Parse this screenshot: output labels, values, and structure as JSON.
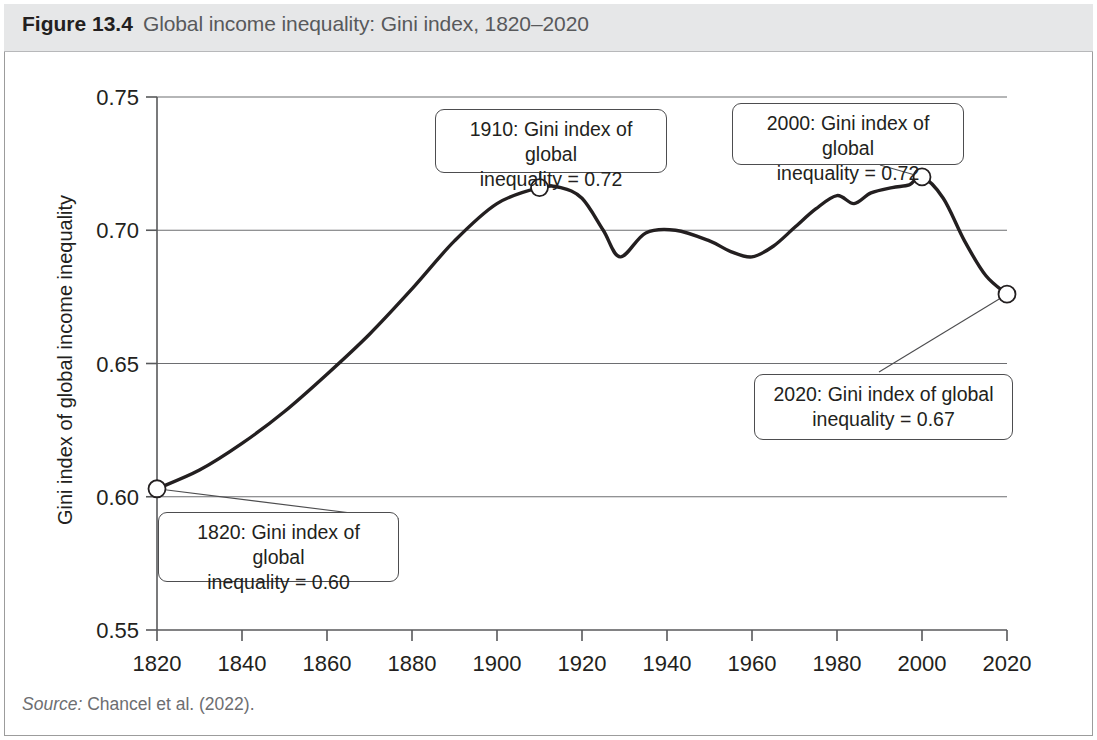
{
  "figure": {
    "number": "Figure 13.4",
    "caption": "Global income inequality: Gini index, 1820–2020",
    "source_word": "Source:",
    "source_text": " Chancel et al. (2022)."
  },
  "colors": {
    "caption_band": "#e6e7e8",
    "line": "#231f20",
    "grid": "#6d6e71",
    "frame": "#9c9c9c",
    "source_text": "#6d6e71"
  },
  "annotations": [
    {
      "id": "callout-1820",
      "name": "annotation-1820",
      "year": 1820,
      "value": 0.6,
      "text": "1820: Gini index of global\ninequality = 0.60"
    },
    {
      "id": "callout-1910",
      "name": "annotation-1910",
      "year": 1910,
      "value": 0.72,
      "text": "1910: Gini index of global\ninequality = 0.72"
    },
    {
      "id": "callout-2000",
      "name": "annotation-2000",
      "year": 2000,
      "value": 0.72,
      "text": "2000: Gini index of global\ninequality = 0.72"
    },
    {
      "id": "callout-2020",
      "name": "annotation-2020",
      "year": 2020,
      "value": 0.67,
      "text": "2020: Gini index of global\ninequality = 0.67"
    }
  ],
  "chart_data": {
    "type": "line",
    "title": "Global income inequality: Gini index, 1820–2020",
    "xlabel": "",
    "ylabel": "Gini index of global income inequality",
    "xlim": [
      1820,
      2020
    ],
    "ylim": [
      0.55,
      0.75
    ],
    "xticks": [
      1820,
      1840,
      1860,
      1880,
      1900,
      1920,
      1940,
      1960,
      1980,
      2000,
      2020
    ],
    "yticks": [
      0.55,
      0.6,
      0.65,
      0.7,
      0.75
    ],
    "ytick_labels": [
      "0.55",
      "0.60",
      "0.65",
      "0.70",
      "0.75"
    ],
    "xtick_labels": [
      "1820",
      "1840",
      "1860",
      "1880",
      "1900",
      "1920",
      "1940",
      "1960",
      "1980",
      "2000",
      "2020"
    ],
    "grid": "horizontal",
    "legend": "none",
    "series": [
      {
        "name": "Gini index of global income inequality",
        "x": [
          1820,
          1830,
          1840,
          1850,
          1860,
          1870,
          1880,
          1890,
          1900,
          1910,
          1915,
          1920,
          1925,
          1929,
          1935,
          1942,
          1950,
          1955,
          1960,
          1965,
          1970,
          1975,
          1980,
          1984,
          1988,
          1993,
          1997,
          2000,
          2005,
          2010,
          2015,
          2020
        ],
        "y": [
          0.603,
          0.61,
          0.62,
          0.632,
          0.646,
          0.661,
          0.678,
          0.696,
          0.71,
          0.716,
          0.716,
          0.712,
          0.7,
          0.69,
          0.699,
          0.7,
          0.696,
          0.692,
          0.69,
          0.694,
          0.701,
          0.708,
          0.713,
          0.71,
          0.714,
          0.716,
          0.717,
          0.72,
          0.712,
          0.696,
          0.683,
          0.676
        ]
      }
    ],
    "markers": [
      {
        "year": 1820,
        "value": 0.603,
        "label": "0.60"
      },
      {
        "year": 1910,
        "value": 0.716,
        "label": "0.72"
      },
      {
        "year": 2000,
        "value": 0.72,
        "label": "0.72"
      },
      {
        "year": 2020,
        "value": 0.676,
        "label": "0.67"
      }
    ]
  }
}
